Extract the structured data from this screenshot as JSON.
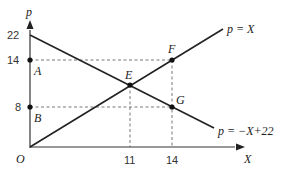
{
  "diagram": {
    "axes": {
      "y_label": "p",
      "x_label": "X",
      "origin_label": "O"
    },
    "y_ticks": [
      {
        "value": "22",
        "y": 35
      },
      {
        "value": "14",
        "y": 60
      },
      {
        "value": "8",
        "y": 107
      }
    ],
    "x_ticks": [
      {
        "value": "11",
        "x": 130
      },
      {
        "value": "14",
        "x": 172
      }
    ],
    "points": {
      "A": {
        "label": "A"
      },
      "B": {
        "label": "B"
      },
      "E": {
        "label": "E"
      },
      "F": {
        "label": "F"
      },
      "G": {
        "label": "G"
      }
    },
    "lines": {
      "supply": {
        "label": "p = X"
      },
      "demand": {
        "label": "p = −X+22"
      }
    },
    "colors": {
      "line": "#222222",
      "dashed": "#444444"
    }
  }
}
